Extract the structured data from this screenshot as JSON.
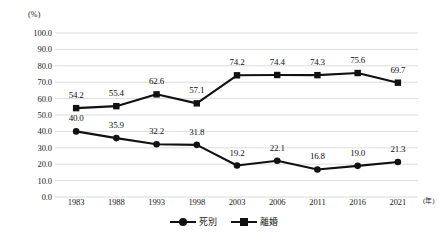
{
  "chart_data": {
    "type": "line",
    "title": "",
    "xlabel": "(年)",
    "ylabel": "(%)",
    "x": [
      "1983",
      "1988",
      "1993",
      "1998",
      "2003",
      "2006",
      "2011",
      "2016",
      "2021"
    ],
    "categories": [
      "1983",
      "1988",
      "1993",
      "1998",
      "2003",
      "2006",
      "2011",
      "2016",
      "2021"
    ],
    "ylim": [
      0.0,
      100.0
    ],
    "yticks": [
      "0.0",
      "10.0",
      "20.0",
      "30.0",
      "40.0",
      "50.0",
      "60.0",
      "70.0",
      "80.0",
      "90.0",
      "100.0"
    ],
    "grid": "horizontal",
    "legend_position": "bottom-center",
    "series": [
      {
        "name": "死別",
        "marker": "circle",
        "color": "#111111",
        "values": [
          40.0,
          35.9,
          32.2,
          31.8,
          19.2,
          22.1,
          16.8,
          19.0,
          21.3
        ],
        "labels": [
          "40.0",
          "35.9",
          "32.2",
          "31.8",
          "19.2",
          "22.1",
          "16.8",
          "19.0",
          "21.3"
        ]
      },
      {
        "name": "離婚",
        "marker": "square",
        "color": "#111111",
        "values": [
          54.2,
          55.4,
          62.6,
          57.1,
          74.2,
          74.4,
          74.3,
          75.6,
          69.7
        ],
        "labels": [
          "54.2",
          "55.4",
          "62.6",
          "57.1",
          "74.2",
          "74.4",
          "74.3",
          "75.6",
          "69.7"
        ]
      }
    ]
  },
  "axes": {
    "y_unit": "(%)",
    "x_unit": "(年)"
  },
  "legend": {
    "entries": [
      {
        "label": "死別",
        "marker": "circle"
      },
      {
        "label": "離婚",
        "marker": "square"
      }
    ]
  },
  "style": {
    "line_color": "#111111",
    "grid_color": "#d9d9d9",
    "background": "#ffffff"
  }
}
